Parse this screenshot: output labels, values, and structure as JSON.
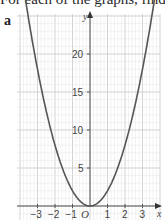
{
  "header": {
    "text": "For each of the graphs, find"
  },
  "part_label": "a",
  "chart_data": {
    "type": "line",
    "title": "",
    "function": "y = 2x^2",
    "xlabel": "x",
    "ylabel": "y",
    "xlim": [
      -4.2,
      4.0
    ],
    "ylim": [
      -1.5,
      25
    ],
    "x_ticks": [
      -3,
      -2,
      -1,
      1,
      2,
      3
    ],
    "x_tick_labels": [
      "−3",
      "−2",
      "−1",
      "1",
      "2",
      "3"
    ],
    "y_ticks": [
      5,
      10,
      15,
      20
    ],
    "y_tick_labels": [
      "5",
      "5",
      "10",
      "15",
      "20"
    ],
    "origin_label": "O",
    "grid": true,
    "series": [
      {
        "name": "curve",
        "x": [
          -3.7,
          -3,
          -2.5,
          -2,
          -1.5,
          -1,
          -0.5,
          0,
          0.5,
          1,
          1.5,
          2,
          2.5,
          3,
          3.7
        ],
        "y": [
          27.4,
          18,
          12.5,
          8,
          4.5,
          2,
          0.5,
          0,
          0.5,
          2,
          4.5,
          8,
          12.5,
          18,
          27.4
        ]
      }
    ]
  },
  "labels": {
    "x_axis": "x",
    "y_axis": "y",
    "origin": "O",
    "xt": [
      "−3",
      "−2",
      "−1",
      "1",
      "2",
      "3"
    ],
    "yt": [
      "5",
      "10",
      "15",
      "20"
    ]
  },
  "colors": {
    "grid_minor": "#e4e4e4",
    "grid_major": "#c8c8c8",
    "axis": "#555555",
    "curve": "#555555"
  }
}
